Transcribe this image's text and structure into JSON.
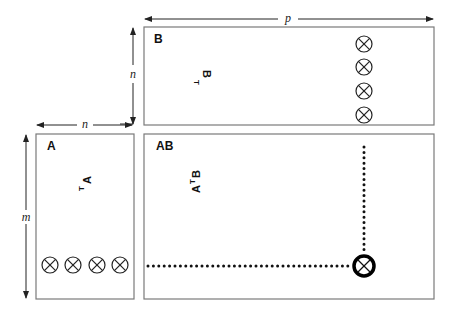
{
  "dimensions": {
    "p": "p",
    "n_top": "n",
    "n_left": "n",
    "m": "m"
  },
  "boxes": {
    "B": {
      "label": "B",
      "annotation_base": "B",
      "annotation_sup": "T"
    },
    "A": {
      "label": "A",
      "annotation_base": "A",
      "annotation_sup": "T"
    },
    "AB": {
      "label": "AB",
      "annotation_base": "A",
      "annotation_sup": "T",
      "annotation_base2": "B"
    }
  },
  "operators": {
    "symbol": "otimes",
    "B_column_count": 4,
    "A_row_count": 4,
    "AB_result_count": 1
  },
  "colors": {
    "box_border": "#7a7a7a",
    "ink": "#222222"
  }
}
